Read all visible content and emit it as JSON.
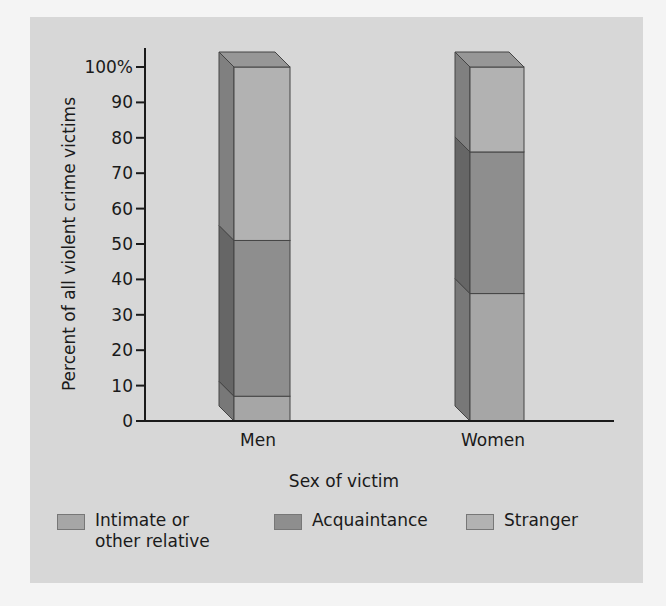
{
  "chart_data": {
    "type": "bar",
    "stacked": true,
    "style": "3d",
    "title": "",
    "xlabel": "Sex of victim",
    "ylabel": "Percent of all violent crime victims",
    "ylim": [
      0,
      100
    ],
    "yticks": [
      "0",
      "10",
      "20",
      "30",
      "40",
      "50",
      "60",
      "70",
      "80",
      "90",
      "100%"
    ],
    "categories": [
      "Men",
      "Women"
    ],
    "series": [
      {
        "name": "Intimate or other relative",
        "values": [
          7,
          36
        ],
        "color": "#a6a6a6"
      },
      {
        "name": "Acquaintance",
        "values": [
          44,
          40
        ],
        "color": "#8e8e8e"
      },
      {
        "name": "Stranger",
        "values": [
          49,
          24
        ],
        "color": "#b2b2b2"
      }
    ],
    "legend_position": "bottom",
    "grid": false
  },
  "legend": {
    "items": [
      {
        "label": "Intimate or\nother relative",
        "color": "#a6a6a6"
      },
      {
        "label": "Acquaintance",
        "color": "#8e8e8e"
      },
      {
        "label": "Stranger",
        "color": "#b2b2b2"
      }
    ]
  },
  "colors": {
    "background": "#d7d7d7",
    "axis": "#1a1a1a"
  }
}
